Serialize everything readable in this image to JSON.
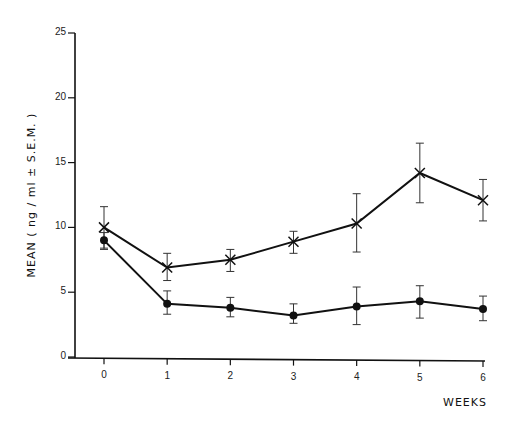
{
  "chart_data": {
    "type": "line",
    "title": "",
    "xlabel": "WEEKS",
    "ylabel": "MEAN ( ng / ml ± S.E.M. )",
    "x": [
      0,
      1,
      2,
      3,
      4,
      5,
      6
    ],
    "xticks": [
      "0",
      "1",
      "2",
      "3",
      "4",
      "5",
      "6"
    ],
    "yticks": [
      "0",
      "5",
      "10",
      "15",
      "20",
      "25"
    ],
    "ylim": [
      0,
      25
    ],
    "grid": false,
    "legend": "none",
    "series": [
      {
        "name": "X marker series",
        "marker": "x",
        "values": [
          10.0,
          6.9,
          7.5,
          8.9,
          10.3,
          14.2,
          12.1
        ],
        "sem_low": [
          8.4,
          5.9,
          6.6,
          8.0,
          8.1,
          11.9,
          10.5
        ],
        "sem_high": [
          11.6,
          8.0,
          8.3,
          9.7,
          12.6,
          16.5,
          13.7
        ]
      },
      {
        "name": "Filled circle series",
        "marker": "circle",
        "values": [
          9.0,
          4.1,
          3.8,
          3.2,
          3.9,
          4.3,
          3.7
        ],
        "sem_low": [
          8.3,
          3.3,
          3.1,
          2.6,
          2.5,
          3.0,
          2.8
        ],
        "sem_high": [
          9.6,
          5.1,
          4.6,
          4.1,
          5.4,
          5.5,
          4.7
        ]
      }
    ]
  }
}
